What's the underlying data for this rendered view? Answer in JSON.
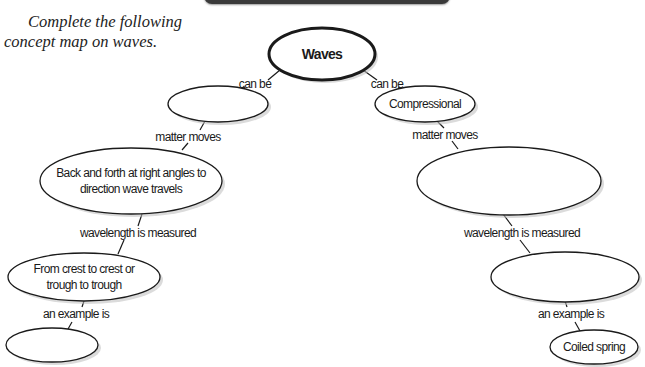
{
  "instructions": {
    "line1": "Complete the following",
    "line2": "concept map on waves."
  },
  "root": {
    "label": "Waves"
  },
  "left_branch": {
    "link_root": "can be",
    "type_node": "",
    "link_matter": "matter moves",
    "matter_node_line1": "Back and forth at right angles to",
    "matter_node_line2": "direction wave travels",
    "link_wavelength": "wavelength is measured",
    "wavelength_node_line1": "From crest to crest or",
    "wavelength_node_line2": "trough to trough",
    "link_example": "an example is",
    "example_node": ""
  },
  "right_branch": {
    "link_root": "can be",
    "type_node": "Compressional",
    "link_matter": "matter moves",
    "matter_node": "",
    "link_wavelength": "wavelength is measured",
    "wavelength_node": "",
    "link_example": "an example is",
    "example_node": "Coiled spring"
  },
  "colors": {
    "banner": "#3a3a3a",
    "stroke": "#1a1a1a",
    "fill": "#ffffff"
  }
}
